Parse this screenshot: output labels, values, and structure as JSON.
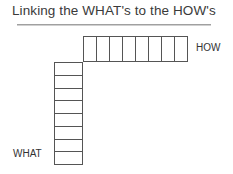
{
  "title": "Linking the WHAT's to the HOW's",
  "how": {
    "label": "HOW",
    "columns": 8
  },
  "what": {
    "label": "WHAT",
    "rows": 8
  },
  "colors": {
    "title": "#3a3a3a",
    "grid_line": "#555555",
    "underline": "#a0a0a0"
  }
}
